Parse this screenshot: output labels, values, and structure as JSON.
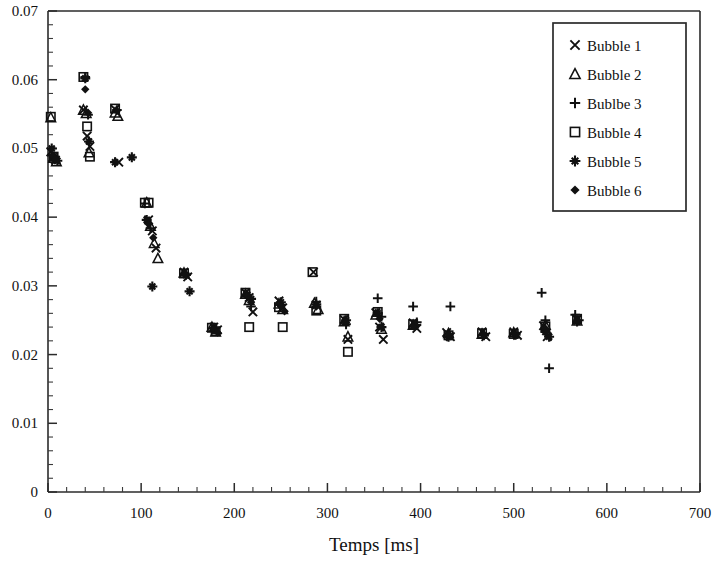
{
  "chart_data": {
    "type": "scatter",
    "title": "",
    "xlabel": "Temps [ms]",
    "ylabel": "",
    "xlim": [
      0,
      700
    ],
    "ylim": [
      0,
      0.07
    ],
    "x_major_ticks": [
      0,
      100,
      200,
      300,
      400,
      500,
      600,
      700
    ],
    "x_tick_labels": [
      "0",
      "100",
      "200",
      "300",
      "400",
      "500",
      "600",
      "700"
    ],
    "x_minor_step": 20,
    "y_major_ticks": [
      0,
      0.01,
      0.02,
      0.03,
      0.04,
      0.05,
      0.06,
      0.07
    ],
    "y_tick_labels": [
      "0",
      "0.01",
      "0.02",
      "0.03",
      "0.04",
      "0.05",
      "0.06",
      "0.07"
    ],
    "y_minor_step": 0.002,
    "grid": false,
    "legend_position": "top-right",
    "marker_color": "#111111",
    "series": [
      {
        "name": "Bubble 1",
        "marker": "x",
        "points": [
          [
            3,
            0.0495
          ],
          [
            5,
            0.0487
          ],
          [
            8,
            0.0483
          ],
          [
            38,
            0.0556
          ],
          [
            42,
            0.0518
          ],
          [
            45,
            0.0503
          ],
          [
            72,
            0.0557
          ],
          [
            76,
            0.048
          ],
          [
            108,
            0.0396
          ],
          [
            112,
            0.038
          ],
          [
            116,
            0.0355
          ],
          [
            146,
            0.032
          ],
          [
            150,
            0.0313
          ],
          [
            178,
            0.024
          ],
          [
            182,
            0.0236
          ],
          [
            212,
            0.029
          ],
          [
            216,
            0.0283
          ],
          [
            220,
            0.0262
          ],
          [
            248,
            0.0278
          ],
          [
            252,
            0.0268
          ],
          [
            285,
            0.032
          ],
          [
            288,
            0.0272
          ],
          [
            318,
            0.0251
          ],
          [
            322,
            0.0222
          ],
          [
            352,
            0.0261
          ],
          [
            356,
            0.024
          ],
          [
            360,
            0.0222
          ],
          [
            392,
            0.0246
          ],
          [
            396,
            0.0238
          ],
          [
            428,
            0.0232
          ],
          [
            432,
            0.0226
          ],
          [
            466,
            0.0233
          ],
          [
            470,
            0.0226
          ],
          [
            500,
            0.0233
          ],
          [
            504,
            0.0228
          ],
          [
            532,
            0.0242
          ],
          [
            536,
            0.0226
          ],
          [
            568,
            0.0251
          ]
        ]
      },
      {
        "name": "Bubble 2",
        "marker": "triangle",
        "points": [
          [
            3,
            0.0545
          ],
          [
            6,
            0.0486
          ],
          [
            9,
            0.0481
          ],
          [
            38,
            0.0556
          ],
          [
            41,
            0.0551
          ],
          [
            44,
            0.0494
          ],
          [
            72,
            0.0552
          ],
          [
            75,
            0.0547
          ],
          [
            106,
            0.0421
          ],
          [
            110,
            0.0387
          ],
          [
            114,
            0.0362
          ],
          [
            118,
            0.034
          ],
          [
            146,
            0.0319
          ],
          [
            176,
            0.024
          ],
          [
            180,
            0.0233
          ],
          [
            212,
            0.0288
          ],
          [
            216,
            0.0279
          ],
          [
            248,
            0.0274
          ],
          [
            252,
            0.0266
          ],
          [
            286,
            0.0275
          ],
          [
            290,
            0.0266
          ],
          [
            318,
            0.0248
          ],
          [
            322,
            0.0226
          ],
          [
            352,
            0.0258
          ],
          [
            358,
            0.0237
          ],
          [
            392,
            0.0243
          ],
          [
            430,
            0.0231
          ],
          [
            466,
            0.023
          ],
          [
            500,
            0.0232
          ],
          [
            534,
            0.0243
          ],
          [
            568,
            0.0249
          ]
        ]
      },
      {
        "name": "Bublbe 3",
        "marker": "plus",
        "points": [
          [
            4,
            0.049
          ],
          [
            7,
            0.0484
          ],
          [
            40,
            0.0604
          ],
          [
            43,
            0.0549
          ],
          [
            74,
            0.0556
          ],
          [
            104,
            0.042
          ],
          [
            110,
            0.0384
          ],
          [
            148,
            0.0317
          ],
          [
            178,
            0.0238
          ],
          [
            214,
            0.0285
          ],
          [
            218,
            0.027
          ],
          [
            250,
            0.0272
          ],
          [
            288,
            0.0277
          ],
          [
            320,
            0.0244
          ],
          [
            354,
            0.0282
          ],
          [
            358,
            0.0255
          ],
          [
            392,
            0.027
          ],
          [
            396,
            0.0247
          ],
          [
            432,
            0.027
          ],
          [
            468,
            0.023
          ],
          [
            502,
            0.0231
          ],
          [
            530,
            0.029
          ],
          [
            534,
            0.025
          ],
          [
            538,
            0.018
          ],
          [
            566,
            0.0258
          ],
          [
            570,
            0.025
          ]
        ]
      },
      {
        "name": "Bubble 4",
        "marker": "square",
        "points": [
          [
            3,
            0.0546
          ],
          [
            6,
            0.0488
          ],
          [
            38,
            0.0604
          ],
          [
            42,
            0.0532
          ],
          [
            45,
            0.0488
          ],
          [
            72,
            0.0558
          ],
          [
            104,
            0.0421
          ],
          [
            108,
            0.0421
          ],
          [
            146,
            0.0318
          ],
          [
            176,
            0.0239
          ],
          [
            180,
            0.0234
          ],
          [
            212,
            0.029
          ],
          [
            216,
            0.024
          ],
          [
            248,
            0.0269
          ],
          [
            252,
            0.024
          ],
          [
            284,
            0.032
          ],
          [
            288,
            0.0264
          ],
          [
            318,
            0.0252
          ],
          [
            322,
            0.0204
          ],
          [
            354,
            0.0262
          ],
          [
            392,
            0.0244
          ],
          [
            430,
            0.0228
          ],
          [
            466,
            0.0231
          ],
          [
            500,
            0.023
          ],
          [
            534,
            0.0241
          ],
          [
            568,
            0.0252
          ]
        ]
      },
      {
        "name": "Bubble 5",
        "marker": "star",
        "points": [
          [
            4,
            0.05
          ],
          [
            7,
            0.0486
          ],
          [
            10,
            0.0482
          ],
          [
            40,
            0.0602
          ],
          [
            44,
            0.051
          ],
          [
            72,
            0.048
          ],
          [
            90,
            0.0487
          ],
          [
            106,
            0.0396
          ],
          [
            112,
            0.0299
          ],
          [
            148,
            0.0316
          ],
          [
            152,
            0.0292
          ],
          [
            178,
            0.0239
          ],
          [
            214,
            0.0287
          ],
          [
            218,
            0.0281
          ],
          [
            250,
            0.0276
          ],
          [
            288,
            0.0273
          ],
          [
            320,
            0.025
          ],
          [
            354,
            0.026
          ],
          [
            358,
            0.024
          ],
          [
            394,
            0.0243
          ],
          [
            430,
            0.0226
          ],
          [
            468,
            0.0228
          ],
          [
            502,
            0.0229
          ],
          [
            534,
            0.0233
          ],
          [
            538,
            0.0226
          ],
          [
            568,
            0.0248
          ]
        ]
      },
      {
        "name": "Bubble 6",
        "marker": "diamond",
        "points": [
          [
            5,
            0.0489
          ],
          [
            8,
            0.0484
          ],
          [
            40,
            0.0586
          ],
          [
            43,
            0.0552
          ],
          [
            74,
            0.0555
          ],
          [
            108,
            0.039
          ],
          [
            113,
            0.037
          ],
          [
            146,
            0.0318
          ],
          [
            178,
            0.0237
          ],
          [
            182,
            0.0232
          ],
          [
            214,
            0.0286
          ],
          [
            218,
            0.0276
          ],
          [
            250,
            0.027
          ],
          [
            254,
            0.0263
          ],
          [
            288,
            0.027
          ],
          [
            320,
            0.0247
          ],
          [
            356,
            0.0252
          ],
          [
            392,
            0.0241
          ],
          [
            430,
            0.0229
          ],
          [
            468,
            0.0229
          ],
          [
            500,
            0.0231
          ],
          [
            534,
            0.0238
          ],
          [
            568,
            0.025
          ]
        ]
      }
    ]
  },
  "legend": {
    "items": [
      {
        "label": "Bubble 1",
        "marker": "x"
      },
      {
        "label": "Bubble 2",
        "marker": "triangle"
      },
      {
        "label": "Bublbe 3",
        "marker": "plus"
      },
      {
        "label": "Bubble 4",
        "marker": "square"
      },
      {
        "label": "Bubble 5",
        "marker": "star"
      },
      {
        "label": "Bubble 6",
        "marker": "diamond"
      }
    ]
  }
}
